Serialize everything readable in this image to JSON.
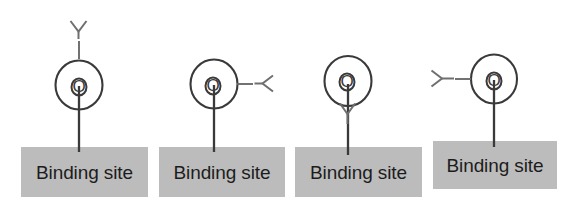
{
  "figure": {
    "background_color": "#ffffff",
    "stroke_color": "#3a3a3a",
    "ligand_color": "#6f6f6f",
    "box_fill_color": "#bcbcbc",
    "box_text_color": "#1c1c1c"
  },
  "units": [
    {
      "id": "unit-1",
      "receptor_label": "O",
      "ligand_label": "Y",
      "ligand_position": "top",
      "site_label": "Binding site"
    },
    {
      "id": "unit-2",
      "receptor_label": "O",
      "ligand_label": "Y",
      "ligand_position": "right",
      "site_label": "Binding site"
    },
    {
      "id": "unit-3",
      "receptor_label": "O",
      "ligand_label": "Y",
      "ligand_position": "below-inverted",
      "site_label": "Binding site"
    },
    {
      "id": "unit-4",
      "receptor_label": "O",
      "ligand_label": "Y",
      "ligand_position": "left",
      "site_label": "Binding site"
    }
  ]
}
